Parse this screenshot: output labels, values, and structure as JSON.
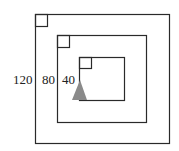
{
  "diagram": {
    "squares": [
      {
        "name": "outer",
        "label": "120"
      },
      {
        "name": "middle",
        "label": "80"
      },
      {
        "name": "inner",
        "label": "40"
      }
    ],
    "marker": {
      "shape": "triangle",
      "color": "#8a8a8a"
    },
    "stroke_color": "#2a2a2a"
  }
}
